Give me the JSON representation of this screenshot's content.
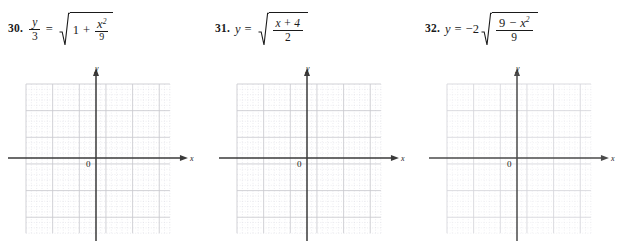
{
  "page": {
    "background": "#ffffff",
    "ink": "#1a1a1a"
  },
  "problems": [
    {
      "number": "30.",
      "equation_plain": "y/3 = sqrt(1 + x^2/9)",
      "lhs": {
        "numerator": "y",
        "denominator": "3"
      },
      "equals": "=",
      "radicand": {
        "term1": "1",
        "operator": "+",
        "fraction": {
          "numerator_base": "x",
          "numerator_exponent": "2",
          "denominator": "9"
        }
      },
      "graph": {
        "x_axis_label": "x",
        "y_axis_label": "y",
        "origin_label": "0",
        "minor_cell_px": 5.33,
        "major_every": 5,
        "grid_color": "#c9c9cf",
        "minor_color": "#d9d9e0",
        "axis_color": "#3a3a3a",
        "cols": 27,
        "rows": 28
      }
    },
    {
      "number": "31.",
      "equation_plain": "y = sqrt((x + 4)/2)",
      "lhs": {
        "variable": "y"
      },
      "equals": "=",
      "radicand": {
        "fraction": {
          "numerator": "x + 4",
          "denominator": "2"
        }
      },
      "graph": {
        "x_axis_label": "x",
        "y_axis_label": "y",
        "origin_label": "0",
        "minor_cell_px": 5.33,
        "major_every": 5,
        "grid_color": "#c9c9cf",
        "minor_color": "#d9d9e0",
        "axis_color": "#3a3a3a",
        "cols": 27,
        "rows": 28
      }
    },
    {
      "number": "32.",
      "equation_plain": "y = -2 sqrt((9 - x^2)/9)",
      "lhs": {
        "variable": "y"
      },
      "equals": "=",
      "coefficient": "−2",
      "radicand": {
        "fraction": {
          "numerator_left": "9",
          "numerator_operator": "−",
          "numerator_right_base": "x",
          "numerator_right_exponent": "2",
          "denominator": "9"
        }
      },
      "graph": {
        "x_axis_label": "x",
        "y_axis_label": "y",
        "origin_label": "0",
        "minor_cell_px": 5.33,
        "major_every": 5,
        "grid_color": "#d4d4da",
        "minor_color": "#e2e2e8",
        "axis_color": "#4a4a4a",
        "cols": 27,
        "rows": 28
      }
    }
  ]
}
